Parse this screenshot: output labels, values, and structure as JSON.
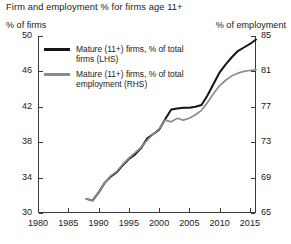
{
  "header": {
    "title": "Firm and employment % for firms age 11+"
  },
  "axes": {
    "left_caption": "% of firms",
    "right_caption": "% of employment",
    "left_ticks": [
      30,
      34,
      38,
      42,
      46,
      50
    ],
    "right_ticks": [
      65,
      69,
      73,
      77,
      81,
      85
    ],
    "x_ticks": [
      1980,
      1985,
      1990,
      1995,
      2000,
      2005,
      2010,
      2015
    ],
    "left_range": [
      30,
      50
    ],
    "right_range": [
      65,
      85
    ],
    "x_range": [
      1980,
      2016
    ]
  },
  "legend": {
    "items": [
      {
        "label": "Mature (11+) firms, % of total\nfirms (LHS)",
        "color": "#141414",
        "swatch": "black"
      },
      {
        "label": "Mature (11+) firms, % of total\nemployment (RHS)",
        "color": "#8d8d8d",
        "swatch": "gray"
      }
    ]
  },
  "chart_data": {
    "type": "line",
    "title": "Firm and employment % for firms age 11+",
    "xlabel": "",
    "ylabel": "% of firms",
    "y2label": "% of employment",
    "xlim": [
      1980,
      2016
    ],
    "ylim": [
      30,
      50
    ],
    "y2lim": [
      65,
      85
    ],
    "grid": false,
    "legend_position": "upper-left",
    "x": [
      1988,
      1989,
      1990,
      1991,
      1992,
      1993,
      1994,
      1995,
      1996,
      1997,
      1998,
      1999,
      2000,
      2001,
      2002,
      2003,
      2004,
      2005,
      2006,
      2007,
      2008,
      2009,
      2010,
      2011,
      2012,
      2013,
      2014,
      2015,
      2016
    ],
    "series": [
      {
        "name": "Mature (11+) firms, % of total firms (LHS)",
        "axis": "left",
        "color": "#141414",
        "values": [
          31.6,
          31.4,
          32.3,
          33.4,
          34.1,
          34.6,
          35.4,
          36.1,
          36.6,
          37.3,
          38.4,
          38.9,
          39.4,
          40.6,
          41.7,
          41.8,
          41.9,
          41.9,
          42.0,
          42.2,
          43.3,
          44.6,
          45.9,
          46.8,
          47.6,
          48.3,
          48.7,
          49.1,
          49.6
        ]
      },
      {
        "name": "Mature (11+) firms, % of total employment (RHS)",
        "axis": "right",
        "color": "#8d8d8d",
        "values": [
          66.6,
          66.4,
          67.3,
          68.4,
          69.2,
          69.7,
          70.5,
          71.2,
          71.8,
          72.4,
          73.2,
          73.9,
          74.5,
          75.5,
          75.3,
          75.7,
          75.5,
          75.7,
          76.1,
          76.6,
          77.5,
          78.5,
          79.4,
          80.0,
          80.5,
          80.8,
          81.0,
          81.1,
          81.2
        ]
      }
    ]
  }
}
